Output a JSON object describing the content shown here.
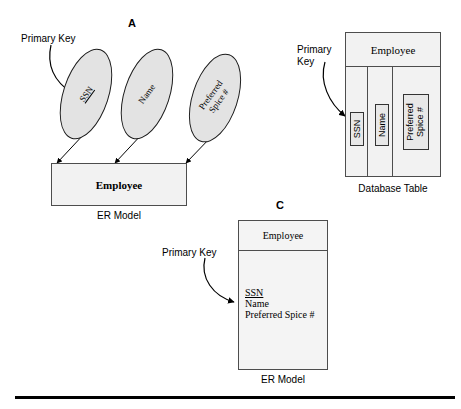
{
  "figure": {
    "background_color": "#ffffff",
    "line_color": "#000000",
    "ellipse_fill": "#e3e3e3",
    "box_fill": "#f2f2f2"
  },
  "panel_a": {
    "letter": "A",
    "callout": "Primary Key",
    "attributes": [
      {
        "name": "SSN",
        "is_primary_key": true
      },
      {
        "name": "Name",
        "is_primary_key": false
      },
      {
        "name": "Preferred\nSpice #",
        "is_primary_key": false
      }
    ],
    "entity_name": "Employee",
    "caption": "ER Model"
  },
  "panel_b": {
    "callout": "Primary\nKey",
    "table_name": "Employee",
    "columns": [
      {
        "label": "SSN",
        "is_primary_key": true
      },
      {
        "label": "Name",
        "is_primary_key": false
      },
      {
        "label": "Preferred\nSpice #",
        "is_primary_key": false
      }
    ],
    "caption": "Database Table"
  },
  "panel_c": {
    "letter": "C",
    "callout": "Primary Key",
    "entity_name": "Employee",
    "attributes": [
      {
        "name": "SSN",
        "is_primary_key": true
      },
      {
        "name": "Name",
        "is_primary_key": false
      },
      {
        "name": "Preferred Spice #",
        "is_primary_key": false
      }
    ],
    "caption": "ER Model"
  }
}
